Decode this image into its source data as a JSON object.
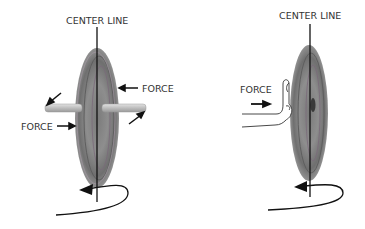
{
  "diagram": {
    "type": "gyroscopic-precession-illustration",
    "panels": [
      {
        "id": "left",
        "subject": "wheel-on-axle",
        "labels": {
          "center_line": "CENTER LINE",
          "force_right": "FORCE",
          "force_left": "FORCE"
        }
      },
      {
        "id": "right",
        "subject": "wheel-pushed-by-hand",
        "labels": {
          "center_line": "CENTER LINE",
          "force": "FORCE"
        }
      }
    ],
    "colors": {
      "wheel_dark": "#6e6e6e",
      "wheel_mid": "#8a8a8a",
      "wheel_light": "#b0b0b0",
      "axle": "#c8c8c8",
      "line": "#111111",
      "text": "#333333"
    }
  }
}
